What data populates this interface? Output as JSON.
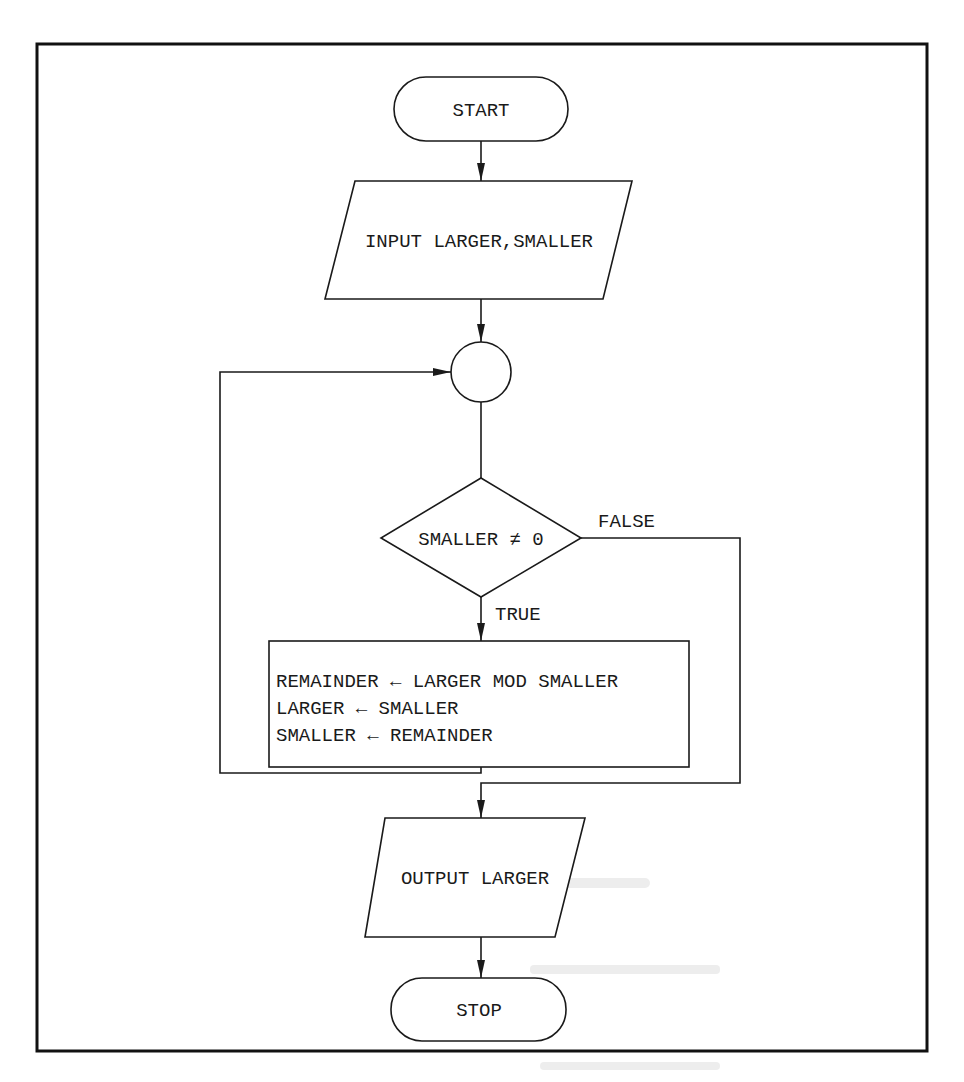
{
  "diagram": {
    "type": "flowchart",
    "frame": {
      "x": 37,
      "y": 44,
      "width": 890,
      "height": 1007
    },
    "colors": {
      "stroke": "#1a1a1a",
      "fill": "#ffffff",
      "background": "#ffffff"
    },
    "nodes": {
      "start": {
        "kind": "terminator",
        "label": "START"
      },
      "input": {
        "kind": "io",
        "label": "INPUT LARGER,SMALLER"
      },
      "connector": {
        "kind": "connector",
        "label": ""
      },
      "decision": {
        "kind": "decision",
        "label": "SMALLER ≠ 0"
      },
      "process": {
        "kind": "process",
        "lines": [
          "REMAINDER ← LARGER MOD SMALLER",
          "LARGER ← SMALLER",
          "SMALLER ← REMAINDER"
        ]
      },
      "output": {
        "kind": "io",
        "label": "OUTPUT LARGER"
      },
      "stop": {
        "kind": "terminator",
        "label": "STOP"
      }
    },
    "edges": {
      "true_label": "TRUE",
      "false_label": "FALSE"
    },
    "flow": [
      {
        "from": "start",
        "to": "input"
      },
      {
        "from": "input",
        "to": "connector"
      },
      {
        "from": "connector",
        "to": "decision"
      },
      {
        "from": "decision",
        "to": "process",
        "label": "TRUE"
      },
      {
        "from": "process",
        "to": "connector",
        "label": "loop back"
      },
      {
        "from": "decision",
        "to": "output",
        "label": "FALSE"
      },
      {
        "from": "output",
        "to": "stop"
      }
    ]
  }
}
